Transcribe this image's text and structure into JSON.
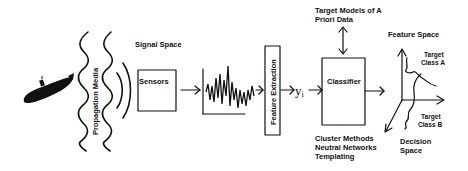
{
  "diagram": {
    "nodes": {
      "propagation_media": "Propagation Media",
      "signal_space": "Signal Space",
      "sensors": "Sensors",
      "feature_extraction": "Feature Extraction",
      "feature_vector": "y",
      "feature_vector_sub": "i",
      "classifier": "Classifier",
      "target_models_line1": "Target Models of A",
      "target_models_line2": "Priori Data",
      "methods_line1": "Cluster Methods",
      "methods_line2": "Neutral Networks",
      "methods_line3": "Templating",
      "feature_space": "Feature Space",
      "target_class_a_line1": "Target",
      "target_class_a_line2": "Class A",
      "target_class_b_line1": "Target",
      "target_class_b_line2": "Class B",
      "decision_space_line1": "Decision",
      "decision_space_line2": "Space"
    },
    "icons": {
      "source": "submarine-icon",
      "signal": "waveform-plot-icon"
    },
    "colors": {
      "ink": "#111111",
      "background": "#ffffff"
    }
  }
}
